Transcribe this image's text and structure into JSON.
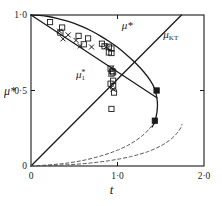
{
  "figure": {
    "background": "#ffffff",
    "ink": "#1a1a1a",
    "width": 222,
    "height": 206
  },
  "chart_data": {
    "type": "line",
    "title": "",
    "subtitle": "",
    "xlabel": "t",
    "ylabel": "μ*",
    "xlim": [
      0,
      2.0
    ],
    "ylim": [
      0,
      1.0
    ],
    "grid": false,
    "legend": "none",
    "xticks": [
      {
        "value": 0,
        "label": "0"
      },
      {
        "value": 1.0,
        "label": "1·0"
      },
      {
        "value": 2.0,
        "label": "2·0"
      }
    ],
    "yticks": [
      {
        "value": 0,
        "label": "0"
      },
      {
        "value": 0.5,
        "label": "0·5"
      },
      {
        "value": 1.0,
        "label": "1·0"
      }
    ],
    "annotations": [
      {
        "name": "mu-star-curve-label",
        "text": "μ*",
        "x": 1.05,
        "y": 0.905,
        "style": "italic"
      },
      {
        "name": "mu-kt-line-label",
        "text": "μ",
        "sub": "KT",
        "x": 1.53,
        "y": 0.845,
        "style": "italic"
      },
      {
        "name": "mu-1-star-label",
        "text": "μ",
        "sub": "1",
        "sup": "*",
        "x": 0.52,
        "y": 0.585,
        "style": "italic"
      }
    ],
    "series": [
      {
        "name": "mu-star-boundary",
        "label": "μ*",
        "style": "solid",
        "color": "#1a1a1a",
        "points": [
          [
            0.0,
            1.0
          ],
          [
            0.1,
            0.997
          ],
          [
            0.2,
            0.99
          ],
          [
            0.3,
            0.978
          ],
          [
            0.4,
            0.963
          ],
          [
            0.5,
            0.944
          ],
          [
            0.6,
            0.921
          ],
          [
            0.7,
            0.894
          ],
          [
            0.8,
            0.862
          ],
          [
            0.9,
            0.826
          ],
          [
            1.0,
            0.786
          ],
          [
            1.1,
            0.739
          ],
          [
            1.2,
            0.687
          ],
          [
            1.3,
            0.626
          ],
          [
            1.38,
            0.566
          ],
          [
            1.43,
            0.512
          ],
          [
            1.455,
            0.452
          ],
          [
            1.462,
            0.4
          ],
          [
            1.455,
            0.352
          ],
          [
            1.44,
            0.312
          ],
          [
            1.425,
            0.285
          ],
          [
            1.41,
            0.268
          ],
          [
            1.4,
            0.258
          ]
        ]
      },
      {
        "name": "mu-1-star-line",
        "label": "μ₁*",
        "style": "solid",
        "color": "#1a1a1a",
        "points": [
          [
            0.0,
            1.0
          ],
          [
            1.455,
            0.452
          ]
        ]
      },
      {
        "name": "mu-kt-line",
        "label": "μ_KT",
        "style": "solid",
        "color": "#1a1a1a",
        "points": [
          [
            0.0,
            0.0
          ],
          [
            1.74,
            1.0
          ]
        ]
      },
      {
        "name": "dashed-branch-upper",
        "label": "",
        "style": "dashed",
        "color": "#555555",
        "points": [
          [
            0.0,
            0.0
          ],
          [
            0.25,
            0.009
          ],
          [
            0.45,
            0.022
          ],
          [
            0.65,
            0.043
          ],
          [
            0.85,
            0.074
          ],
          [
            1.0,
            0.105
          ],
          [
            1.12,
            0.137
          ],
          [
            1.22,
            0.172
          ],
          [
            1.31,
            0.212
          ],
          [
            1.37,
            0.248
          ],
          [
            1.4,
            0.268
          ],
          [
            1.4,
            0.258
          ]
        ]
      },
      {
        "name": "dashed-branch-lower",
        "label": "",
        "style": "dashed",
        "color": "#555555",
        "points": [
          [
            0.0,
            0.0
          ],
          [
            0.3,
            0.005
          ],
          [
            0.6,
            0.015
          ],
          [
            0.9,
            0.035
          ],
          [
            1.15,
            0.062
          ],
          [
            1.35,
            0.095
          ],
          [
            1.5,
            0.133
          ],
          [
            1.6,
            0.17
          ],
          [
            1.68,
            0.212
          ],
          [
            1.73,
            0.252
          ],
          [
            1.745,
            0.276
          ]
        ]
      }
    ],
    "scatter": [
      {
        "name": "open-square-data",
        "marker": "open-square",
        "color": "#1a1a1a",
        "points": [
          [
            0.22,
            0.953
          ],
          [
            0.36,
            0.917
          ],
          [
            0.34,
            0.883
          ],
          [
            0.55,
            0.862
          ],
          [
            0.66,
            0.845
          ],
          [
            0.61,
            0.806
          ],
          [
            0.82,
            0.81
          ],
          [
            0.85,
            0.793
          ],
          [
            0.9,
            0.79
          ],
          [
            0.93,
            0.778
          ],
          [
            0.9,
            0.752
          ],
          [
            0.93,
            0.748
          ],
          [
            0.92,
            0.645
          ],
          [
            0.94,
            0.628
          ],
          [
            0.95,
            0.62
          ],
          [
            0.93,
            0.612
          ],
          [
            0.95,
            0.565
          ],
          [
            0.92,
            0.545
          ],
          [
            0.95,
            0.528
          ],
          [
            0.96,
            0.486
          ],
          [
            0.93,
            0.378
          ]
        ]
      },
      {
        "name": "cross-data",
        "marker": "cross",
        "color": "#1a1a1a",
        "points": [
          [
            0.33,
            0.893
          ],
          [
            0.43,
            0.868
          ],
          [
            0.37,
            0.842
          ],
          [
            0.52,
            0.832
          ],
          [
            0.57,
            0.795
          ],
          [
            0.7,
            0.788
          ],
          [
            0.87,
            0.79
          ],
          [
            0.93,
            0.648
          ],
          [
            0.95,
            0.508
          ]
        ]
      },
      {
        "name": "filled-square-data",
        "marker": "filled-square",
        "color": "#1a1a1a",
        "points": [
          [
            1.452,
            0.5
          ],
          [
            1.432,
            0.3
          ]
        ]
      }
    ]
  }
}
